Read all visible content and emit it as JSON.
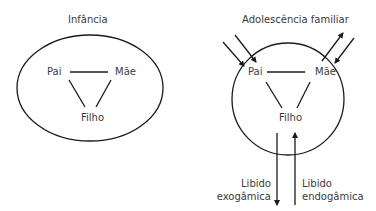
{
  "diagrams": [
    {
      "title": "Infância",
      "nodes": {
        "top_left": "Pai",
        "top_right": "Mãe",
        "bottom": "Filho"
      }
    },
    {
      "title": "Adolescência familiar",
      "nodes": {
        "top_left": "Pai",
        "top_right": "Mãe",
        "bottom": "Filho"
      },
      "flows": {
        "outgoing_label_line1": "Libido",
        "outgoing_label_line2": "exogâmica",
        "incoming_label_line1": "Libido",
        "incoming_label_line2": "endogâmica"
      }
    }
  ],
  "colors": {
    "stroke": "#1a1a1a",
    "text": "#3a3a3a",
    "background": "#ffffff"
  }
}
